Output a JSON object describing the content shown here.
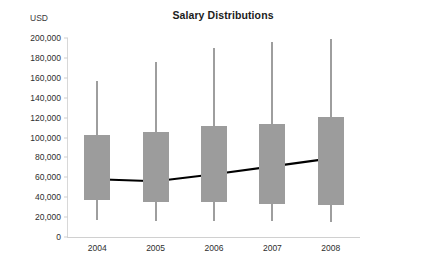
{
  "chart_data": {
    "type": "bar",
    "subtype": "box-plot-with-trend-line",
    "title": "Salary Distributions",
    "xlabel": "",
    "ylabel": "USD",
    "categories": [
      "2004",
      "2005",
      "2006",
      "2007",
      "2008"
    ],
    "ylim": [
      0,
      200000
    ],
    "ytick_step": 20000,
    "ytick_labels": [
      "200,000",
      "180,000",
      "160,000",
      "140,000",
      "120,000",
      "100,000",
      "80,000",
      "60,000",
      "40,000",
      "20,000",
      "0"
    ],
    "ytick_values": [
      200000,
      180000,
      160000,
      140000,
      120000,
      100000,
      80000,
      60000,
      40000,
      20000,
      0
    ],
    "grid": false,
    "legend": "none",
    "series": [
      {
        "name": "Salary distribution (box)",
        "whisker_high": [
          157000,
          176000,
          190000,
          196000,
          199000
        ],
        "box_high": [
          103000,
          106000,
          112000,
          114000,
          121000
        ],
        "box_low": [
          37000,
          35000,
          35000,
          33000,
          32000
        ],
        "whisker_low": [
          17000,
          16000,
          16000,
          16000,
          15000
        ]
      },
      {
        "name": "Median trend",
        "values": [
          58000,
          56000,
          63000,
          71000,
          79000
        ]
      }
    ],
    "colors": {
      "box_fill": "#9c9c9c",
      "whisker": "#9e9e9e",
      "trend_line": "#000000",
      "axis": "#d0d0d0",
      "text": "#2e2e2e",
      "background": "#ffffff"
    }
  }
}
